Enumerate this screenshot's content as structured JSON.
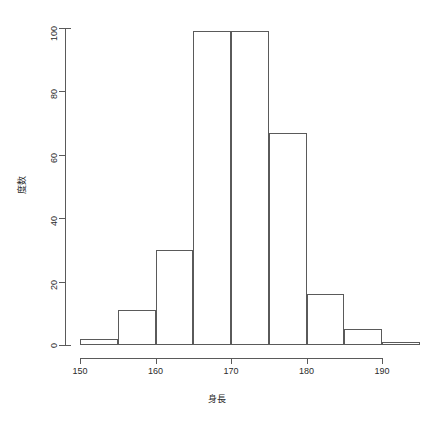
{
  "chart_data": {
    "type": "bar",
    "title": "",
    "subtitle": "",
    "xlabel": "身長",
    "ylabel": "度数",
    "xlim": [
      148,
      196
    ],
    "ylim": [
      0,
      100
    ],
    "grid": false,
    "legend": "none",
    "bin_width": 5,
    "categories": [
      "150-155",
      "155-160",
      "160-165",
      "165-170",
      "170-175",
      "175-180",
      "180-185",
      "185-190",
      "190-195"
    ],
    "bin_edges": [
      150,
      155,
      160,
      165,
      170,
      175,
      180,
      185,
      190,
      195
    ],
    "values": [
      2,
      11,
      30,
      99,
      99,
      67,
      16,
      5,
      1
    ],
    "x_ticks": [
      150,
      160,
      170,
      180,
      190
    ],
    "x_tick_labels": [
      "150",
      "160",
      "170",
      "180",
      "190"
    ],
    "y_ticks": [
      0,
      20,
      40,
      60,
      80,
      100
    ],
    "y_tick_labels": [
      "0",
      "20",
      "40",
      "60",
      "80",
      "100"
    ],
    "bar_color": "#ffffff",
    "bar_border_color": "#5a5a5a",
    "axis_color": "#5a5a5a",
    "background": "#ffffff"
  }
}
